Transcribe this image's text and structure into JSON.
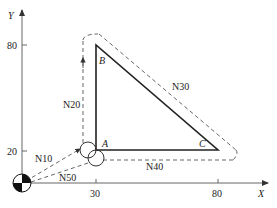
{
  "axes": {
    "x_label": "X",
    "y_label": "Y",
    "x_ticks": [
      {
        "value": "30",
        "px": 96
      },
      {
        "value": "80",
        "px": 218
      }
    ],
    "y_ticks": [
      {
        "value": "80",
        "px": 45
      },
      {
        "value": "20",
        "px": 151
      }
    ]
  },
  "points": {
    "A": {
      "label": "A",
      "x": 30,
      "y": 20
    },
    "B": {
      "label": "B",
      "x": 30,
      "y": 80
    },
    "C": {
      "label": "C",
      "x": 80,
      "y": 20
    }
  },
  "blocks": {
    "n10": "N10",
    "n20": "N20",
    "n30": "N30",
    "n40": "N40",
    "n50": "N50"
  },
  "colors": {
    "part_outline": "#222222",
    "tool_path": "#555555",
    "axis": "#666666"
  }
}
